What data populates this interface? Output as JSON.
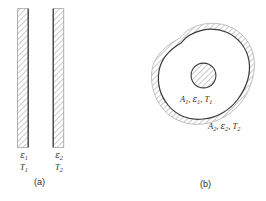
{
  "figure": {
    "type": "engineering-diagram",
    "background_color": "#ffffff",
    "line_color": "#3a3a3a",
    "hatch_color": "#8a8a8a",
    "text_color": "#2b2b2b"
  },
  "panel_a": {
    "caption": "(a)",
    "description": "two large parallel plates facing each other",
    "plate_left": {
      "emissivity_symbol": "ε",
      "emissivity_subscript": "1",
      "temperature_symbol": "T",
      "temperature_subscript": "1",
      "hatch_side": "left",
      "surface_line_side": "right"
    },
    "plate_right": {
      "emissivity_symbol": "ε",
      "emissivity_subscript": "2",
      "temperature_symbol": "T",
      "temperature_subscript": "2",
      "hatch_side": "right",
      "surface_line_side": "left"
    }
  },
  "panel_b": {
    "caption": "(b)",
    "description": "small convex body enclosed by a large irregular enclosure",
    "inner_body": {
      "label_parts": [
        "A",
        "1",
        ",",
        "ε",
        "1",
        ",",
        "T",
        "2_unused"
      ],
      "label_text": "A₁, ε₁, T₁",
      "area_symbol": "A",
      "area_subscript": "1",
      "emissivity_symbol": "ε",
      "emissivity_subscript": "1",
      "temperature_symbol": "T",
      "temperature_subscript": "1",
      "shape": "circle-hatched"
    },
    "enclosure": {
      "label_text": "A₂, ε₂, T₂",
      "area_symbol": "A",
      "area_subscript": "2",
      "emissivity_symbol": "ε",
      "emissivity_subscript": "2",
      "temperature_symbol": "T",
      "temperature_subscript": "2",
      "shape": "irregular-blob-hatched-outside"
    }
  }
}
